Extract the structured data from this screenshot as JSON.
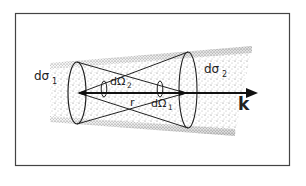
{
  "figure": {
    "labels": {
      "dsigma1": "dσ",
      "dsigma1_sub": "1",
      "dsigma2": "dσ",
      "dsigma2_sub": "2",
      "domega2": "dΩ",
      "domega2_sub": "2",
      "domega1": "dΩ",
      "domega1_sub": "1",
      "r": "r",
      "k": "k"
    },
    "colors": {
      "ink": "#222222",
      "frame": "#444444",
      "stipple": "#555555",
      "background": "#ffffff"
    }
  }
}
